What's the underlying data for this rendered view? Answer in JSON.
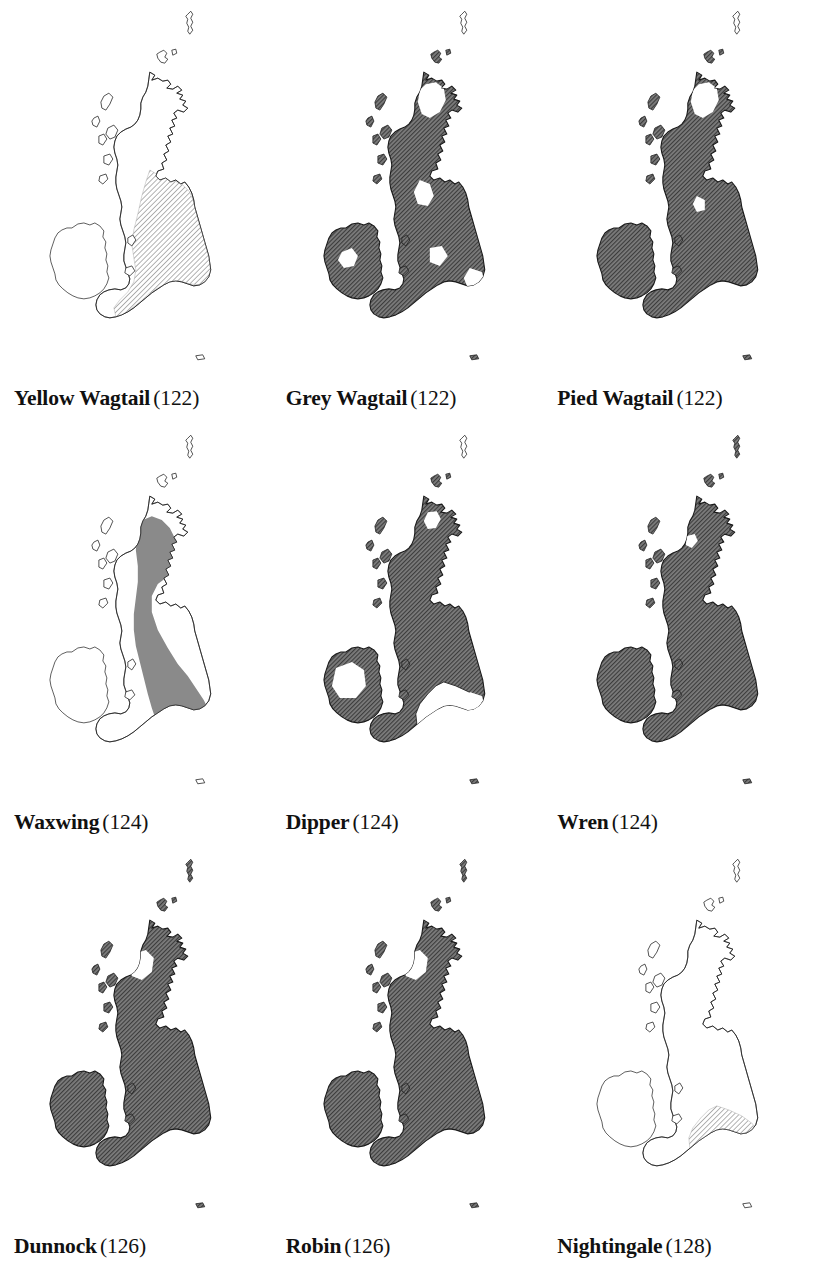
{
  "page": {
    "layout": "3x3 grid of British Isles species distribution maps",
    "columns": 3,
    "rows": 3,
    "background_color": "#ffffff",
    "ink_color": "#111111"
  },
  "legend_colors": {
    "solid_gray_fill": "#8a8a8a",
    "dark_hatch_base": "#7d7d7d",
    "dark_hatch_line": "#3c3c3c",
    "light_hatch_base": "#ffffff",
    "light_hatch_line": "#9a9a9a",
    "coastline_outline": "#1a1a1a",
    "unfilled": "#ffffff"
  },
  "maps": [
    {
      "id": "yellow-wagtail",
      "species": "Yellow Wagtail",
      "page": "(122)",
      "fill_style": "light-hatch",
      "regions": {
        "ireland": "none",
        "scotland": "none",
        "n_england": "light-hatch",
        "s_england": "light-hatch",
        "wales": "none",
        "shetland": "none"
      }
    },
    {
      "id": "grey-wagtail",
      "species": "Grey Wagtail",
      "page": "(122)",
      "fill_style": "dark-hatch",
      "regions": {
        "ireland": "dark-hatch",
        "scotland": "dark-hatch-with-gaps",
        "n_england": "dark-hatch",
        "s_england": "dark-hatch-with-gaps",
        "wales": "dark-hatch",
        "shetland": "none"
      }
    },
    {
      "id": "pied-wagtail",
      "species": "Pied Wagtail",
      "page": "(122)",
      "fill_style": "dark-hatch",
      "regions": {
        "ireland": "dark-hatch",
        "scotland": "dark-hatch-with-gaps",
        "n_england": "dark-hatch",
        "s_england": "dark-hatch",
        "wales": "dark-hatch",
        "shetland": "none"
      }
    },
    {
      "id": "waxwing",
      "species": "Waxwing",
      "page": "(124)",
      "fill_style": "solid-gray",
      "regions": {
        "ireland": "none",
        "scotland": "solid-gray-east",
        "n_england": "solid-gray-east",
        "s_england": "solid-gray-east",
        "wales": "none",
        "shetland": "none"
      }
    },
    {
      "id": "dipper",
      "species": "Dipper",
      "page": "(124)",
      "fill_style": "dark-hatch",
      "regions": {
        "ireland": "dark-hatch-with-gaps",
        "scotland": "dark-hatch-with-gaps",
        "n_england": "dark-hatch-west",
        "s_england": "none",
        "wales": "dark-hatch",
        "shetland": "none"
      }
    },
    {
      "id": "wren",
      "species": "Wren",
      "page": "(124)",
      "fill_style": "dark-hatch",
      "regions": {
        "ireland": "dark-hatch",
        "scotland": "dark-hatch-with-gaps",
        "n_england": "dark-hatch",
        "s_england": "dark-hatch",
        "wales": "dark-hatch",
        "shetland": "dark-hatch"
      }
    },
    {
      "id": "dunnock",
      "species": "Dunnock",
      "page": "(126)",
      "fill_style": "dark-hatch",
      "regions": {
        "ireland": "dark-hatch",
        "scotland": "dark-hatch-with-gaps",
        "n_england": "dark-hatch",
        "s_england": "dark-hatch",
        "wales": "dark-hatch",
        "shetland": "dark-hatch"
      }
    },
    {
      "id": "robin",
      "species": "Robin",
      "page": "(126)",
      "fill_style": "dark-hatch",
      "regions": {
        "ireland": "dark-hatch",
        "scotland": "dark-hatch-with-gaps",
        "n_england": "dark-hatch",
        "s_england": "dark-hatch",
        "wales": "dark-hatch",
        "shetland": "dark-hatch"
      }
    },
    {
      "id": "nightingale",
      "species": "Nightingale",
      "page": "(128)",
      "fill_style": "light-hatch",
      "regions": {
        "ireland": "none",
        "scotland": "none",
        "n_england": "none",
        "s_england": "light-hatch-southeast",
        "wales": "none",
        "shetland": "none"
      }
    }
  ]
}
